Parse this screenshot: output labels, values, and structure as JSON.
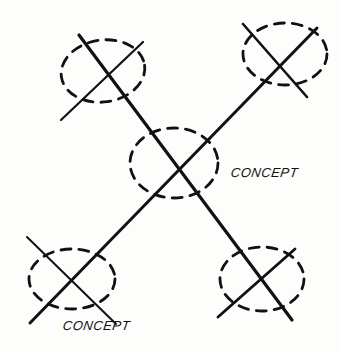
{
  "diagram": {
    "type": "hand-drawn crossing lines with dashed ellipses",
    "labels": [
      {
        "id": "center",
        "text": "CONCEPT"
      },
      {
        "id": "bottom",
        "text": "CONCEPT"
      }
    ],
    "colors": {
      "ink": "#111111",
      "paper": "#fdfdfc"
    }
  }
}
